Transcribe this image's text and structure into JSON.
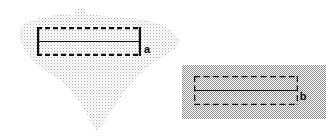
{
  "figure": {
    "title": "",
    "background_color": "#ffffff",
    "width": 333,
    "height": 139,
    "panels": [
      {
        "id": "panel-a",
        "label": "a",
        "label_x": 147,
        "label_y": 50,
        "region_shape": "irregular-polygon",
        "region_description": "irregular stippled outline region",
        "region_fill_color": "#c8c8c8",
        "region_fill_pattern": "fine-stipple",
        "region_polygon_points": "19,33 24,23 40,18 62,14 74,16 76,9 84,8 88,14 104,16 124,18 142,19 160,24 172,31 180,40 176,48 166,55 154,62 144,70 134,80 124,92 116,104 108,116 102,126 97,131 92,124 86,112 78,100 70,90 62,82 54,76 44,70 34,62 26,52 20,42",
        "inner_box": {
          "shape": "rectangle",
          "x": 37,
          "y": 27,
          "width": 104,
          "height": 29,
          "top_edge_style": "dashed",
          "bottom_edge_style": "dashed",
          "left_edge_style": "solid",
          "right_edge_style": "solid",
          "stroke_color": "#111111",
          "stroke_width": 2.2,
          "center_line_style": "solid",
          "center_line_color": "#111111",
          "center_line_width": 1.1
        }
      },
      {
        "id": "panel-b",
        "label": "b",
        "label_x": 303,
        "label_y": 97,
        "region_shape": "rectangle",
        "region_description": "rectangular dithered region",
        "region_fill_color": "#bfbfbf",
        "region_fill_pattern": "checkerboard-dither",
        "region_rect": {
          "x": 182,
          "y": 65,
          "width": 144,
          "height": 54
        },
        "inner_box": {
          "shape": "rectangle",
          "x": 194,
          "y": 76,
          "width": 104,
          "height": 29,
          "top_edge_style": "dashed",
          "bottom_edge_style": "dashed",
          "left_edge_style": "dashed",
          "right_edge_style": "dashed",
          "stroke_color": "#111111",
          "stroke_width": 1.3,
          "center_line_style": "solid",
          "center_line_color": "#111111",
          "center_line_width": 1.1
        }
      }
    ]
  }
}
